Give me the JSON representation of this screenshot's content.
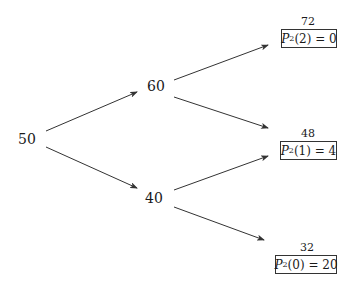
{
  "diagram": {
    "type": "binomial-tree",
    "root": {
      "value": "50"
    },
    "level1": [
      {
        "value": "60"
      },
      {
        "value": "40"
      }
    ],
    "leaves": [
      {
        "price": "72",
        "label_symbol": "P",
        "label_sub": "2",
        "label_arg": "(2)",
        "label_eq": " = 0"
      },
      {
        "price": "48",
        "label_symbol": "P",
        "label_sub": "2",
        "label_arg": "(1)",
        "label_eq": " = 4"
      },
      {
        "price": "32",
        "label_symbol": "P",
        "label_sub": "2",
        "label_arg": "(0)",
        "label_eq": " = 20"
      }
    ],
    "edges": [
      {
        "from": "50",
        "to": "60"
      },
      {
        "from": "50",
        "to": "40"
      },
      {
        "from": "60",
        "to": "72"
      },
      {
        "from": "60",
        "to": "48"
      },
      {
        "from": "40",
        "to": "48"
      },
      {
        "from": "40",
        "to": "32"
      }
    ],
    "colors": {
      "line": "#333333",
      "text": "#1a1a1a",
      "background": "#ffffff"
    }
  }
}
